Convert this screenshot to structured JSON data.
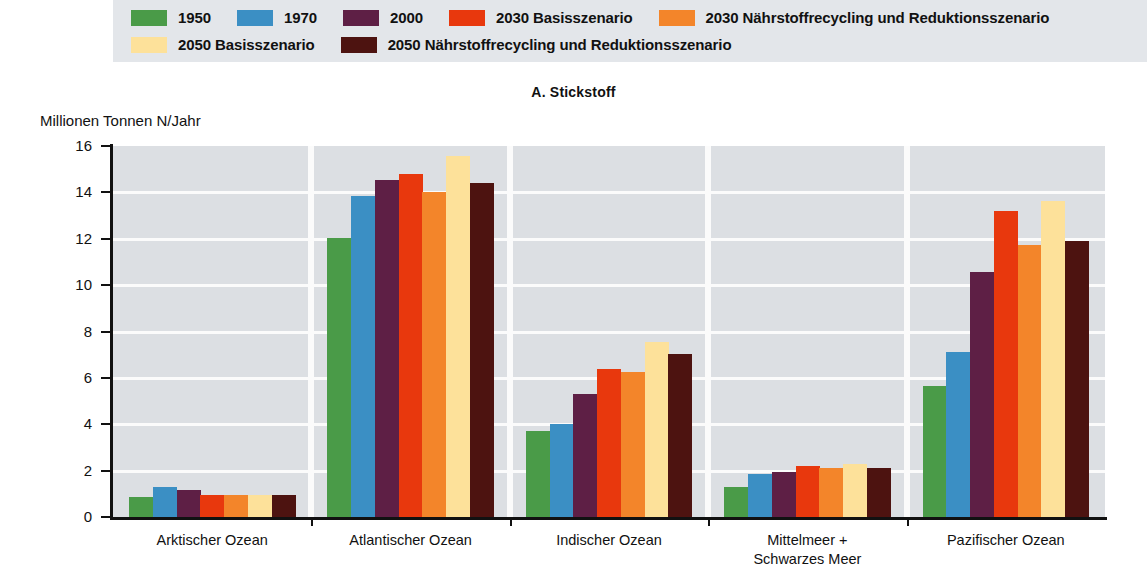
{
  "chart_title": "A. Stickstoff",
  "y_axis_title": "Millionen Tonnen N/Jahr",
  "legend": {
    "rows": [
      [
        {
          "label": "1950",
          "color": "#4a9b48"
        },
        {
          "label": "1970",
          "color": "#3b8fc4"
        },
        {
          "label": "2000",
          "color": "#5e1f45"
        },
        {
          "label": "2030 Basisszenario",
          "color": "#e8380d"
        },
        {
          "label": "2030 Nährstoffrecycling und Reduktionsszenario",
          "color": "#f3852a"
        }
      ],
      [
        {
          "label": "2050 Basisszenario",
          "color": "#fde19a"
        },
        {
          "label": "2050 Nährstoffrecycling und Reduktionsszenario",
          "color": "#4d1310"
        }
      ]
    ]
  },
  "chart_data": {
    "type": "bar",
    "title": "A. Stickstoff",
    "xlabel": "",
    "ylabel": "Millionen Tonnen N/Jahr",
    "ylim": [
      0,
      16
    ],
    "ytick_labels": [
      "16",
      "14",
      "12",
      "10",
      "8",
      "6",
      "4",
      "2",
      "0"
    ],
    "yticks": [
      16,
      14,
      12,
      10,
      8,
      6,
      4,
      2,
      0
    ],
    "grid": true,
    "legend_position": "top",
    "categories": [
      "Arktischer Ozean",
      "Atlantischer Ozean",
      "Indischer Ozean",
      "Mittelmeer +\nSchwarzes Meer",
      "Pazifischer Ozean"
    ],
    "series": [
      {
        "name": "1950",
        "color": "#4a9b48",
        "values": [
          0.85,
          12.05,
          3.7,
          1.3,
          5.65
        ]
      },
      {
        "name": "1970",
        "color": "#3b8fc4",
        "values": [
          1.3,
          13.85,
          4.0,
          1.85,
          7.1
        ]
      },
      {
        "name": "2000",
        "color": "#5e1f45",
        "values": [
          1.15,
          14.55,
          5.3,
          1.95,
          10.55
        ]
      },
      {
        "name": "2030 Basisszenario",
        "color": "#e8380d",
        "values": [
          0.95,
          14.8,
          6.4,
          2.2,
          13.2
        ]
      },
      {
        "name": "2030 Nährstoffrecycling und Reduktionsszenario",
        "color": "#f3852a",
        "values": [
          0.95,
          14.0,
          6.25,
          2.1,
          11.75
        ]
      },
      {
        "name": "2050 Basisszenario",
        "color": "#fde19a",
        "values": [
          0.95,
          15.55,
          7.55,
          2.3,
          13.65
        ]
      },
      {
        "name": "2050 Nährstoffrecycling und Reduktionsszenario",
        "color": "#4d1310",
        "values": [
          0.95,
          14.4,
          7.05,
          2.1,
          11.9
        ]
      }
    ]
  }
}
